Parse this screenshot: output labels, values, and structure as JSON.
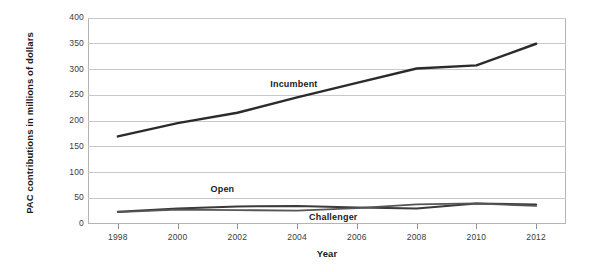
{
  "chart_data": {
    "type": "line",
    "title": "",
    "xlabel": "Year",
    "ylabel": "PAC contributions in millions of dollars",
    "x": [
      1998,
      2000,
      2002,
      2004,
      2006,
      2008,
      2010,
      2012
    ],
    "xtick_labels": [
      "1998",
      "2000",
      "2002",
      "2004",
      "2006",
      "2008",
      "2010",
      "2012"
    ],
    "ytick_labels": [
      "0",
      "50",
      "100",
      "150",
      "200",
      "250",
      "300",
      "350",
      "400"
    ],
    "yticks": [
      0,
      50,
      100,
      150,
      200,
      250,
      300,
      350,
      400
    ],
    "ylim": [
      0,
      400
    ],
    "xlim": [
      1997,
      2013
    ],
    "grid": true,
    "legend_position": "inline-annotations",
    "series": [
      {
        "name": "Incumbent",
        "color": "#2b2b2b",
        "values": [
          170,
          196,
          216,
          246,
          274,
          302,
          308,
          350
        ],
        "label_x_year": 2003.1,
        "label_y_value": 268
      },
      {
        "name": "Open",
        "color": "#3a3a3a",
        "values": [
          24,
          30,
          34,
          35,
          32,
          30,
          40,
          38
        ],
        "label_x_year": 2001.1,
        "label_y_value": 64
      },
      {
        "name": "Challenger",
        "color": "#555555",
        "values": [
          23,
          28,
          27,
          26,
          31,
          38,
          40,
          35
        ],
        "label_x_year": 2004.4,
        "label_y_value": 9
      }
    ]
  }
}
